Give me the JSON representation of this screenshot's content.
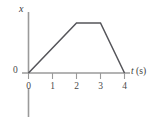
{
  "chart_data": {
    "type": "line",
    "title": "",
    "subtitle": "",
    "xlabel": "t (s)",
    "xlabel_symbol": "t",
    "xlabel_unit": "(s)",
    "ylabel": "x",
    "origin_label": "0",
    "xticks": [
      0,
      1,
      2,
      3,
      4
    ],
    "xtick_labels": [
      "0",
      "1",
      "2",
      "3",
      "4"
    ],
    "yticks": [],
    "ytick_labels": [],
    "xlim": [
      0,
      4.45
    ],
    "ylim": [
      0,
      1.12
    ],
    "grid": false,
    "legend": null,
    "annotations": [],
    "series": [
      {
        "name": "position",
        "x": [
          0,
          2,
          3,
          4
        ],
        "values": [
          0,
          1,
          1,
          0
        ],
        "color": "#55555a",
        "shape": "trapezoid"
      }
    ],
    "axis_color": "#9a9a9a",
    "line_color": "#55555a"
  }
}
